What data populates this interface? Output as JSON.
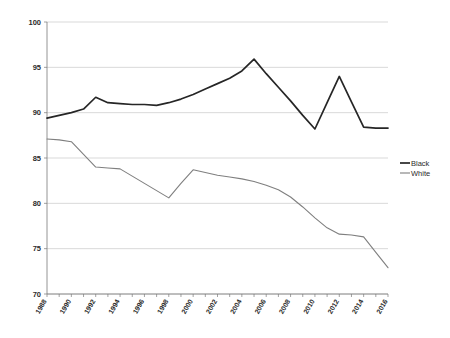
{
  "chart_data": {
    "type": "line",
    "title": "",
    "subtitle": "",
    "xlabel": "",
    "ylabel": "",
    "ylim": [
      70,
      100
    ],
    "xlim": [
      1988,
      2016
    ],
    "yticks": [
      70,
      75,
      80,
      85,
      90,
      95,
      100
    ],
    "grid": true,
    "legend_position": "right",
    "x": [
      1988,
      1989,
      1990,
      1991,
      1992,
      1993,
      1994,
      1995,
      1996,
      1997,
      1998,
      1999,
      2000,
      2001,
      2002,
      2003,
      2004,
      2005,
      2006,
      2007,
      2008,
      2009,
      2010,
      2011,
      2012,
      2013,
      2014,
      2015,
      2016
    ],
    "xtick_labels": [
      "1988",
      "1990",
      "1992",
      "1994",
      "1996",
      "1998",
      "2000",
      "2002",
      "2004",
      "2006",
      "2008",
      "2010",
      "2012",
      "2014",
      "2016"
    ],
    "xtick_values": [
      1988,
      1990,
      1992,
      1994,
      1996,
      1998,
      2000,
      2002,
      2004,
      2006,
      2008,
      2010,
      2012,
      2014,
      2016
    ],
    "series": [
      {
        "name": "Black",
        "color": "#262626",
        "width": 1.7,
        "values": [
          89.4,
          89.7,
          90.0,
          90.4,
          91.7,
          91.1,
          91.0,
          90.9,
          90.9,
          90.8,
          91.1,
          91.5,
          92.0,
          92.6,
          93.2,
          93.8,
          94.6,
          95.9,
          94.3,
          92.8,
          91.3,
          89.7,
          88.2,
          91.1,
          94.0,
          91.2,
          88.4,
          88.3,
          88.3
        ]
      },
      {
        "name": "White",
        "color": "#7f7f7f",
        "width": 1.1,
        "values": [
          87.1,
          87.0,
          86.8,
          85.4,
          84.0,
          83.9,
          83.8,
          83.0,
          82.2,
          81.4,
          80.6,
          82.2,
          83.7,
          83.4,
          83.1,
          82.9,
          82.7,
          82.4,
          82.0,
          81.5,
          80.7,
          79.6,
          78.4,
          77.3,
          76.6,
          76.5,
          76.3,
          74.6,
          72.9
        ]
      }
    ],
    "legend_entries": [
      {
        "label": "Black",
        "color": "#262626"
      },
      {
        "label": "White",
        "color": "#7f7f7f"
      }
    ]
  },
  "colors": {
    "background": "#ffffff",
    "grid": "#c8c8c8",
    "axis": "#7a7a7a",
    "text": "#2b2b2b",
    "series_black": "#262626",
    "series_white": "#7f7f7f"
  }
}
